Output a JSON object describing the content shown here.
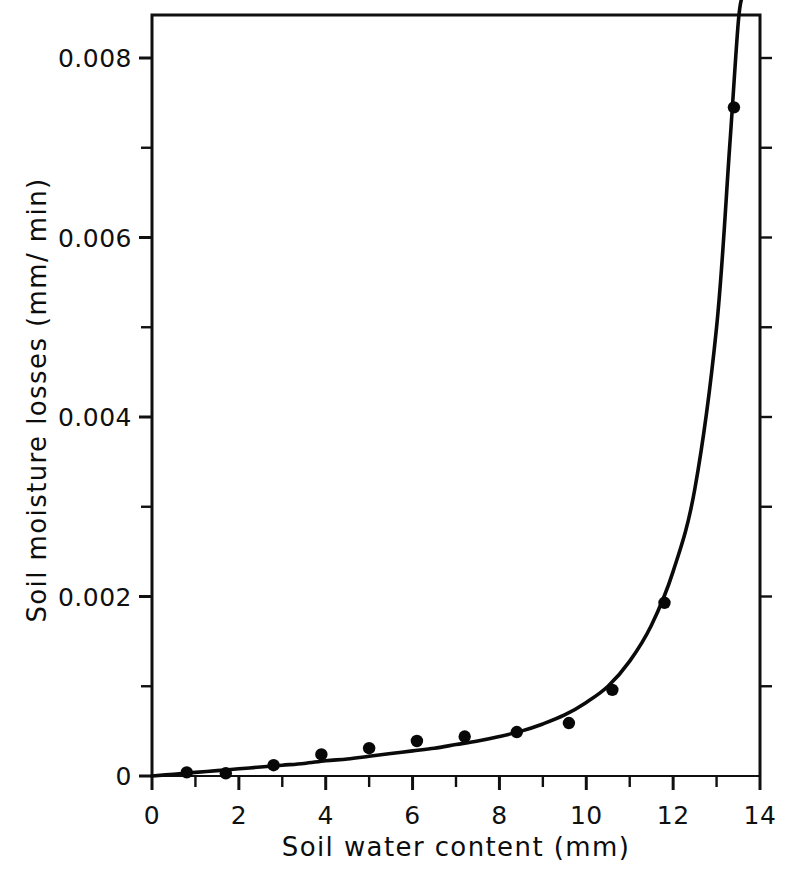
{
  "chart_data": {
    "type": "scatter",
    "title": "",
    "xlabel": "Soil water content  (mm)",
    "ylabel": "Soil  moisture  losses  (mm/ min)",
    "xlim": [
      0,
      14
    ],
    "ylim": [
      0,
      0.0085
    ],
    "grid": false,
    "legend": null,
    "x_ticks_major": [
      0,
      2,
      4,
      6,
      8,
      10,
      12,
      14
    ],
    "x_tick_labels": [
      "0",
      "2",
      "4",
      "6",
      "8",
      "10",
      "12",
      "14"
    ],
    "x_ticks_minor": [
      1,
      3,
      5,
      7,
      9,
      11,
      13
    ],
    "y_ticks_major": [
      0,
      0.002,
      0.004,
      0.006,
      0.008
    ],
    "y_tick_labels": [
      "0",
      "0.002",
      "0.004",
      "0.006",
      "0.008"
    ],
    "y_ticks_minor": [
      0.001,
      0.003,
      0.005,
      0.007
    ],
    "series": [
      {
        "name": "measured soil moisture losses",
        "marker": "filled-circle",
        "x": [
          0.8,
          1.7,
          2.8,
          3.9,
          5.0,
          6.1,
          7.2,
          8.4,
          9.6,
          10.6,
          11.8,
          13.4
        ],
        "y": [
          4e-05,
          3e-05,
          0.00012,
          0.00024,
          0.00031,
          0.00039,
          0.00044,
          0.00049,
          0.00059,
          0.00096,
          0.00193,
          0.00745
        ]
      },
      {
        "name": "fitted exponential curve",
        "style": "solid-line",
        "x": [
          0.0,
          0.5,
          1.0,
          1.5,
          2.0,
          2.5,
          3.0,
          3.5,
          4.0,
          4.5,
          5.0,
          5.5,
          6.0,
          6.5,
          7.0,
          7.5,
          8.0,
          8.5,
          9.0,
          9.5,
          10.0,
          10.5,
          11.0,
          11.5,
          12.0,
          12.5,
          13.0,
          13.3,
          13.5,
          13.6
        ],
        "y": [
          0.0,
          2e-05,
          4e-05,
          6e-05,
          8e-05,
          0.0001,
          0.00012,
          0.00014,
          0.00017,
          0.00019,
          0.00022,
          0.00025,
          0.00028,
          0.00031,
          0.00035,
          0.00039,
          0.00044,
          0.0005,
          0.00058,
          0.00068,
          0.00082,
          0.001,
          0.00128,
          0.00168,
          0.00228,
          0.0032,
          0.005,
          0.007,
          0.0084,
          0.0087
        ]
      }
    ]
  },
  "axes": {
    "x_title": "Soil water content  (mm)",
    "y_title": "Soil  moisture  losses  (mm/ min)"
  },
  "colors": {
    "ink": "#0a0a0a",
    "background": "#ffffff"
  }
}
